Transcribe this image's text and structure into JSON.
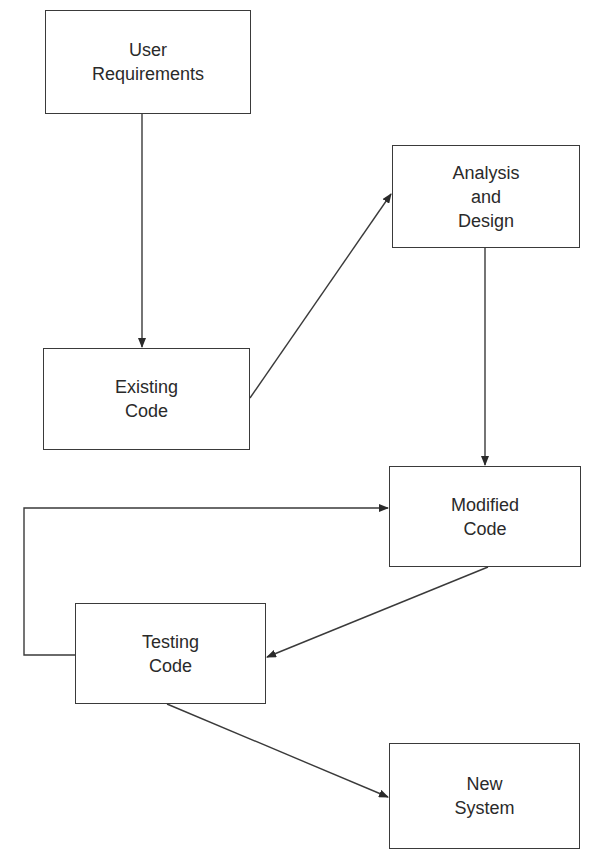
{
  "diagram": {
    "type": "flowchart",
    "stroke_color": "#3a3a3a",
    "nodes": [
      {
        "id": "user_requirements",
        "lines": [
          "User",
          "Requirements"
        ],
        "x": 45,
        "y": 10,
        "w": 206,
        "h": 104
      },
      {
        "id": "analysis_design",
        "lines": [
          "Analysis",
          "and",
          "Design"
        ],
        "x": 392,
        "y": 145,
        "w": 188,
        "h": 103
      },
      {
        "id": "existing_code",
        "lines": [
          "Existing",
          "Code"
        ],
        "x": 43,
        "y": 348,
        "w": 207,
        "h": 102
      },
      {
        "id": "modified_code",
        "lines": [
          "Modified",
          "Code"
        ],
        "x": 389,
        "y": 466,
        "w": 192,
        "h": 101
      },
      {
        "id": "testing_code",
        "lines": [
          "Testing",
          "Code"
        ],
        "x": 75,
        "y": 603,
        "w": 191,
        "h": 101
      },
      {
        "id": "new_system",
        "lines": [
          "New",
          "System"
        ],
        "x": 389,
        "y": 743,
        "w": 191,
        "h": 106
      }
    ],
    "edges": [
      {
        "from": "user_requirements",
        "to": "existing_code"
      },
      {
        "from": "existing_code",
        "to": "analysis_design"
      },
      {
        "from": "analysis_design",
        "to": "modified_code"
      },
      {
        "from": "modified_code",
        "to": "testing_code"
      },
      {
        "from": "testing_code",
        "to": "modified_code",
        "routing": "feedback loop via left side"
      },
      {
        "from": "testing_code",
        "to": "new_system"
      }
    ]
  }
}
